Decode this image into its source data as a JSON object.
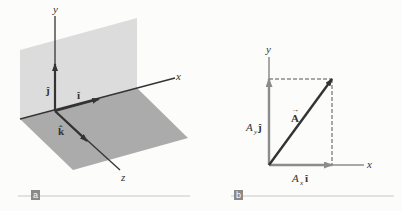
{
  "panel_a": {
    "badge": "a",
    "axes": {
      "x": "x",
      "y": "y",
      "z": "z"
    },
    "unit_vectors": {
      "i": "î",
      "j": "ĵ",
      "k": "k̂"
    },
    "colors": {
      "vertical_plane": "#dcdcdc",
      "floor_plane": "#ababab",
      "axis": "#333333"
    }
  },
  "panel_b": {
    "badge": "b",
    "axes": {
      "x": "x",
      "y": "y"
    },
    "vector_label": "A",
    "vector_arrow": "→",
    "component_y": {
      "coef": "A",
      "sub": "y",
      "unit": "ĵ"
    },
    "component_x": {
      "coef": "A",
      "sub": "x",
      "unit": "î"
    },
    "colors": {
      "vector": "#333333",
      "component": "#8c8c8c",
      "dashed": "#555555"
    }
  },
  "caption_line_color": "#c8c8c8",
  "badge_color": "#8a8a8a"
}
